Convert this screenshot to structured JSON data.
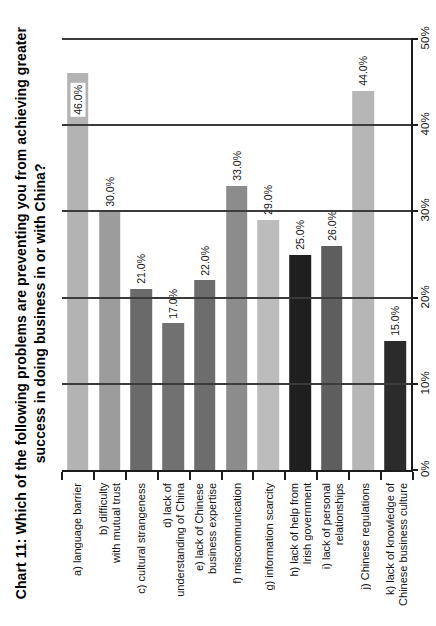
{
  "title": {
    "line1": "Chart 11:  Which of the following problems are preventing you from achieving greater",
    "line2": "success in doing business in or with China?"
  },
  "chart_data": {
    "type": "bar",
    "title": "Chart 11: Which of the following problems are preventing you from achieving greater success in doing business in or with China?",
    "orientation": "column chart rotated 90° counter-clockwise (all text reads bottom-to-top, value axis on the right)",
    "value_axis": {
      "min": 0,
      "max": 50,
      "tick_step": 10,
      "tick_labels": [
        "0%",
        "10%",
        "20%",
        "30%",
        "40%",
        "50%"
      ],
      "grid": true
    },
    "categories": [
      "a) language barrier",
      "b) difficulty\nwith mutual trust",
      "c) cultural strangeness",
      "d) lack of\nunderstanding of China",
      "e) lack of Chinese\nbusiness expertise",
      "f) miscommunication",
      "g) information scarcity",
      "h) lack of help from\nIrish government",
      "i) lack of personal\nrelationships",
      "j) Chinese regulations",
      "k) lack of knowledge of\nChinese business culture"
    ],
    "values": [
      46.0,
      30.0,
      21.0,
      17.0,
      22.0,
      33.0,
      29.0,
      25.0,
      26.0,
      44.0,
      15.0
    ],
    "bars": [
      {
        "category": "a) language barrier",
        "value": 46.0,
        "label": "46.0%",
        "color": "#b3b3b3",
        "label_inside": true,
        "texture": false
      },
      {
        "category": "b) difficulty\nwith mutual trust",
        "value": 30.0,
        "label": "30.0%",
        "color": "#9c9c9c",
        "label_inside": false,
        "texture": false
      },
      {
        "category": "c) cultural strangeness",
        "value": 21.0,
        "label": "21.0%",
        "color": "#6a6a6a",
        "label_inside": false,
        "texture": false
      },
      {
        "category": "d) lack of\nunderstanding of China",
        "value": 17.0,
        "label": "17.0%",
        "color": "#717171",
        "label_inside": false,
        "texture": false
      },
      {
        "category": "e) lack of Chinese\nbusiness expertise",
        "value": 22.0,
        "label": "22.0%",
        "color": "#6d6d6d",
        "label_inside": false,
        "texture": true
      },
      {
        "category": "f) miscommunication",
        "value": 33.0,
        "label": "33.0%",
        "color": "#8c8c8c",
        "label_inside": false,
        "texture": true
      },
      {
        "category": "g) information scarcity",
        "value": 29.0,
        "label": "29.0%",
        "color": "#bcbcbc",
        "label_inside": false,
        "texture": false
      },
      {
        "category": "h) lack of help from\nIrish government",
        "value": 25.0,
        "label": "25.0%",
        "color": "#1f1f1f",
        "label_inside": false,
        "texture": false
      },
      {
        "category": "i) lack of personal\nrelationships",
        "value": 26.0,
        "label": "26.0%",
        "color": "#5e5e5e",
        "label_inside": false,
        "texture": false
      },
      {
        "category": "j) Chinese regulations",
        "value": 44.0,
        "label": "44.0%",
        "color": "#b6b6b6",
        "label_inside": false,
        "texture": false
      },
      {
        "category": "k) lack of knowledge of\nChinese business culture",
        "value": 15.0,
        "label": "15.0%",
        "color": "#2b2b2b",
        "label_inside": false,
        "texture": false
      }
    ],
    "colors": {
      "axis": "#1c1c1c",
      "gridline": "#3b3b3b",
      "label_background": "#ffffff",
      "text": "#111111"
    }
  }
}
